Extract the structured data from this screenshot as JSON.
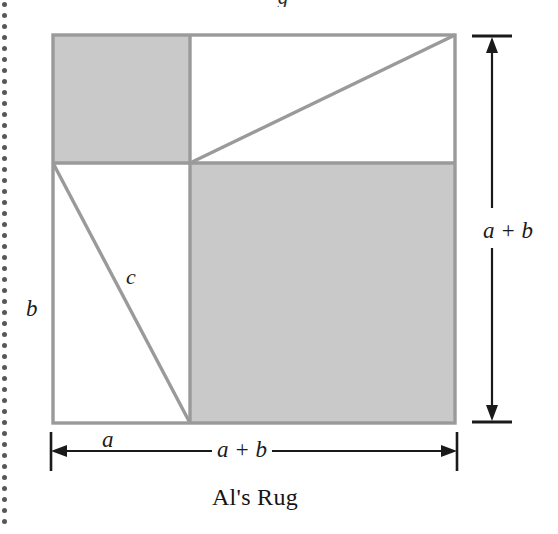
{
  "figure": {
    "caption": "Al's Rug",
    "cut_off_glyph_above": "g",
    "labels": {
      "side_b": "b",
      "hypotenuse_c": "c",
      "segment_a": "a",
      "total_width": "a + b",
      "total_height": "a + b"
    },
    "colors": {
      "shaded_fill": "#c9c9c9",
      "outline": "#9a9a9a",
      "dimension_line": "#1a1a1a",
      "background": "#ffffff",
      "binding_dot": "#3a3a3a"
    },
    "geometry": {
      "square_left": 53,
      "square_top": 35,
      "square_right": 455,
      "square_bottom": 423,
      "divider_x": 190,
      "divider_y": 163,
      "shaded_regions": [
        "top-left-square",
        "bottom-right-square"
      ],
      "white_regions": [
        "top-right-rectangle",
        "bottom-left-rectangle"
      ],
      "diagonals": [
        {
          "name": "top-right-diagonal",
          "from": [
            190,
            163
          ],
          "to": [
            455,
            35
          ]
        },
        {
          "name": "bottom-left-diagonal-c",
          "from": [
            53,
            163
          ],
          "to": [
            190,
            423
          ]
        }
      ]
    },
    "dimensions": [
      {
        "name": "bottom-width",
        "orientation": "horizontal",
        "label": "a + b",
        "from_x": 51,
        "to_x": 457,
        "y": 451
      },
      {
        "name": "right-height",
        "orientation": "vertical",
        "label": "a + b",
        "from_y": 37,
        "to_y": 421,
        "x": 492
      }
    ],
    "binding": {
      "dot_count": 48,
      "dot_spacing": 11,
      "dot_diameter": 5
    }
  }
}
